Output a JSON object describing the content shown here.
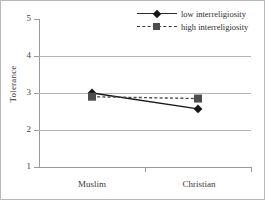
{
  "chart_data": {
    "type": "line",
    "title": "",
    "xlabel": "",
    "ylabel": "Tolerance",
    "categories": [
      "Muslim",
      "Christian"
    ],
    "ylim": [
      1,
      5
    ],
    "yticks": [
      1,
      2,
      3,
      4,
      5
    ],
    "ytick_labels": [
      "1",
      "2",
      "3",
      "4",
      "5"
    ],
    "grid": "horizontal gridlines at 2, 3, 4",
    "legend_position": "top-right inside plot",
    "series": [
      {
        "name": "low interreligiosity",
        "values": [
          3.0,
          2.57
        ],
        "marker": "filled-diamond",
        "line_style": "solid",
        "color": "#161616"
      },
      {
        "name": "high interreligiosity",
        "values": [
          2.9,
          2.85
        ],
        "marker": "filled-square",
        "line_style": "dashed",
        "color": "#4d4d4d"
      }
    ]
  },
  "axis": {
    "y_title": "Tolerance",
    "y_tick_5": "5",
    "y_tick_4": "4",
    "y_tick_3": "3",
    "y_tick_2": "2",
    "y_tick_1": "1",
    "x_tick_muslim": "Muslim",
    "x_tick_christian": "Christian"
  },
  "legend": {
    "items": [
      {
        "label": "low interreligiosity"
      },
      {
        "label": "high interreligiosity"
      }
    ]
  },
  "colors": {
    "series_low": "#161616",
    "series_high": "#4d4d4d",
    "gridline": "#b5b5b5",
    "axis": "#9a9a9a",
    "frame": "#b9b9b9"
  }
}
